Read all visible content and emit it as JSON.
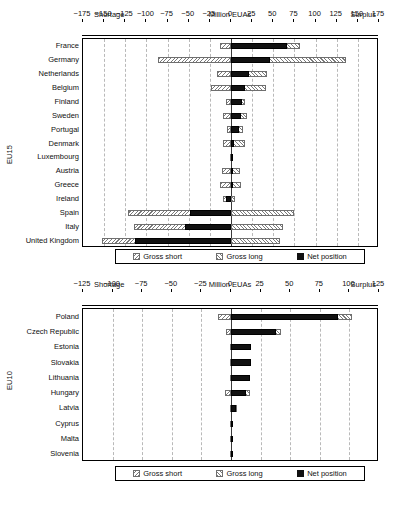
{
  "chart_data": [
    {
      "type": "bar",
      "id": "eu15",
      "title": "Million EUAs",
      "left_header": "Shortage",
      "right_header": "Surplus",
      "ylabel": "EU15",
      "xlabel": "Million EUAs",
      "orientation": "horizontal",
      "grid": true,
      "legend_position": "bottom",
      "xlim": [
        -175,
        175
      ],
      "xticks": [
        -175,
        -150,
        -125,
        -100,
        -75,
        -50,
        -25,
        0,
        25,
        50,
        75,
        100,
        125,
        150,
        175
      ],
      "xticklabels": [
        "−175",
        "−150",
        "−125",
        "−100",
        "−75",
        "−50",
        "−25",
        "0",
        "25",
        "50",
        "75",
        "100",
        "125",
        "150",
        "175"
      ],
      "categories": [
        "France",
        "Germany",
        "Netherlands",
        "Belgium",
        "Finland",
        "Sweden",
        "Portugal",
        "Denmark",
        "Luxembourg",
        "Austria",
        "Greece",
        "Ireland",
        "Spain",
        "Italy",
        "United Kingdom"
      ],
      "series": [
        {
          "name": "Gross short",
          "values": [
            -13,
            -86,
            -16,
            -24,
            -6,
            -9,
            -5,
            -9,
            -1,
            -11,
            -13,
            -10,
            -122,
            -115,
            -153
          ]
        },
        {
          "name": "Gross long",
          "values": [
            81,
            136,
            42,
            41,
            16,
            19,
            14,
            16,
            2,
            11,
            12,
            5,
            74,
            62,
            58
          ]
        },
        {
          "name": "Net position",
          "values": [
            66,
            46,
            21,
            16,
            13,
            12,
            10,
            3,
            2,
            0,
            0,
            -6,
            -48,
            -54,
            -114
          ]
        }
      ]
    },
    {
      "type": "bar",
      "id": "eu10",
      "title": "Million EUAs",
      "left_header": "Shortage",
      "right_header": "Surplus",
      "ylabel": "EU10",
      "xlabel": "Million EUAs",
      "orientation": "horizontal",
      "grid": true,
      "legend_position": "bottom",
      "xlim": [
        -125,
        125
      ],
      "xticks": [
        -125,
        -100,
        -75,
        -50,
        -25,
        0,
        25,
        50,
        75,
        100,
        125
      ],
      "xticklabels": [
        "−125",
        "−100",
        "−75",
        "−50",
        "−25",
        "0",
        "25",
        "50",
        "75",
        "100",
        "125"
      ],
      "categories": [
        "Poland",
        "Czech Republic",
        "Estonia",
        "Slovakia",
        "Lithuania",
        "Hungary",
        "Latvia",
        "Cyprus",
        "Malta",
        "Slovenia"
      ],
      "series": [
        {
          "name": "Gross short",
          "values": [
            -11,
            -4,
            -1,
            -1,
            -1,
            -5,
            -1,
            -1,
            -0.5,
            -1
          ]
        },
        {
          "name": "Gross long",
          "values": [
            102,
            42,
            17,
            17,
            16,
            16,
            5,
            2,
            0.5,
            1
          ]
        },
        {
          "name": "Net position",
          "values": [
            90,
            38,
            17,
            17,
            16,
            13,
            4,
            1,
            0.3,
            0.5
          ]
        }
      ]
    }
  ],
  "legend": {
    "items": [
      {
        "label": "Gross short",
        "marker": "short"
      },
      {
        "label": "Gross long",
        "marker": "long"
      },
      {
        "label": "Net position",
        "marker": "net"
      }
    ]
  }
}
